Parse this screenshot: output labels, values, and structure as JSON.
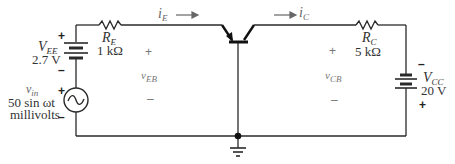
{
  "diagram": {
    "sources": {
      "vee": {
        "name": "V",
        "sub": "EE",
        "value": "2.7 V",
        "plus": "+",
        "minus": "–"
      },
      "vin": {
        "name": "v",
        "sub": "in",
        "value": "50 sin ωt",
        "unit": "millivolts",
        "plus": "+",
        "minus": "–"
      },
      "vcc": {
        "name": "V",
        "sub": "CC",
        "value": "20 V",
        "plus": "+",
        "minus": "–"
      }
    },
    "resistors": {
      "re": {
        "name": "R",
        "sub": "E",
        "value": "1 kΩ"
      },
      "rc": {
        "name": "R",
        "sub": "C",
        "value": "5 kΩ"
      }
    },
    "currents": {
      "ie": {
        "name": "i",
        "sub": "E"
      },
      "ic": {
        "name": "i",
        "sub": "C"
      }
    },
    "voltages": {
      "veb": {
        "name": "v",
        "sub": "EB",
        "plus": "+",
        "minus": "–"
      },
      "vcb": {
        "name": "v",
        "sub": "CB",
        "plus": "+",
        "minus": "–"
      }
    },
    "colors": {
      "wire": "#2a2a2a",
      "text": "#333333",
      "faint_text": "#777777",
      "background": "#ffffff"
    }
  }
}
